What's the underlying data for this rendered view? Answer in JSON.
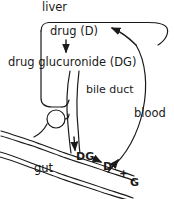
{
  "diagram": {
    "stroke_color": "#1a1a1a",
    "background_color": "#ffffff",
    "labels": {
      "liver": "liver",
      "drug": "drug (D)",
      "drug_glucuronide": "drug glucuronide (DG)",
      "bile_duct": "bile duct",
      "blood": "blood",
      "gut": "gut",
      "gut_dg": "DG",
      "gut_d": "D",
      "gut_plus": "+",
      "gut_g": "G"
    },
    "arrows": [
      {
        "name": "drug-to-glucuronide",
        "from": "drug (D)",
        "to": "drug glucuronide (DG)",
        "direction": "down"
      },
      {
        "name": "bile-duct-to-gut",
        "from": "bile duct",
        "to": "gut",
        "direction": "down"
      },
      {
        "name": "dg-to-d-plus-g",
        "from": "DG",
        "to": "D + G",
        "direction": "right"
      },
      {
        "name": "gut-to-blood",
        "from": "gut",
        "to": "blood",
        "direction": "up-right"
      },
      {
        "name": "blood-to-liver",
        "from": "blood",
        "to": "liver",
        "direction": "up-left"
      }
    ]
  }
}
